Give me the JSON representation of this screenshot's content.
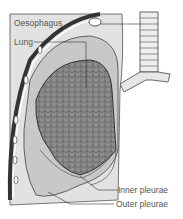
{
  "diagram": {
    "labels": {
      "oesophagus": "Oesophagus",
      "lung": "Lung",
      "inner_pleurae": "Inner pleurae",
      "outer_pleurae": "Outer pleurae"
    },
    "colors": {
      "background_panel": "#dcdcdc",
      "lung_tissue": "#8a8a8a",
      "pleura_outer": "#c8c8c8",
      "outline": "#333333",
      "trachea": "#eeeeee"
    }
  }
}
